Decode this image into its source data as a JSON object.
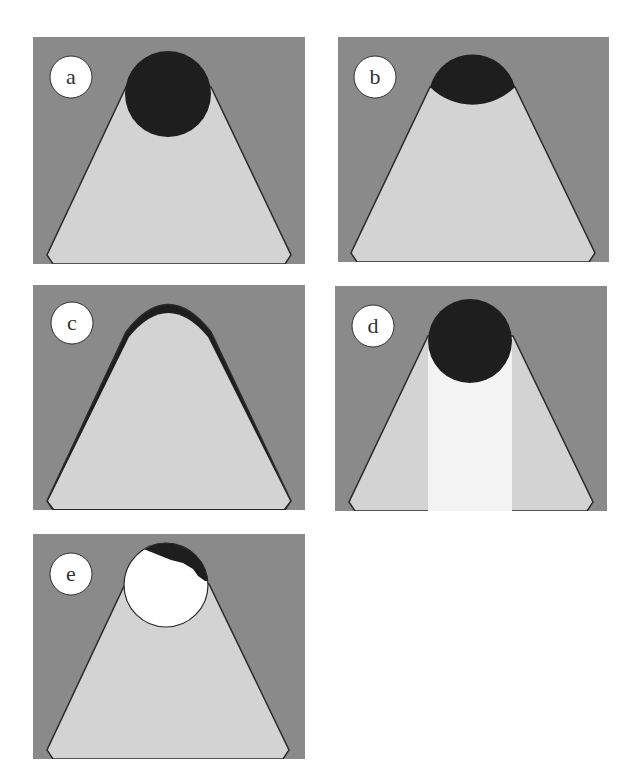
{
  "colors": {
    "background": "#8a8a8a",
    "trapezoid": "#d3d3d3",
    "dark": "#1e1e1e",
    "bright": "#f3f3f3",
    "white": "#ffffff",
    "outline": "#2a2a2a"
  },
  "panels": [
    {
      "id": "a",
      "label": "a",
      "variant": "full-dark-circle"
    },
    {
      "id": "b",
      "label": "b",
      "variant": "half-dark-cap"
    },
    {
      "id": "c",
      "label": "c",
      "variant": "thin-dark-crescent"
    },
    {
      "id": "d",
      "label": "d",
      "variant": "dark-circle-bright-stripe"
    },
    {
      "id": "e",
      "label": "e",
      "variant": "dark-and-white-circle"
    }
  ]
}
